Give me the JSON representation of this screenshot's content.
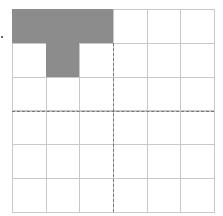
{
  "figure": {
    "rows": 6,
    "cols": 6,
    "shaded_cells": [
      [
        0,
        0
      ],
      [
        0,
        1
      ],
      [
        0,
        2
      ],
      [
        1,
        1
      ]
    ],
    "dashed_lines": {
      "vertical_after_col": 3,
      "horizontal_after_row": 3
    },
    "colors": {
      "shade": "#8c8c8c",
      "grid": "#c8c8c8",
      "dash": "#777777"
    },
    "marker": "dot"
  }
}
